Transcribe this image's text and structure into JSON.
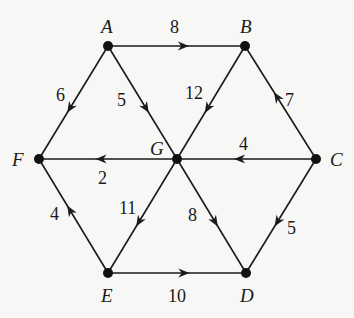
{
  "diagram": {
    "type": "directed-weighted-graph",
    "colors": {
      "background": "#f7f7f5",
      "ink": "#1a1a1a"
    },
    "nodes": [
      {
        "id": "A",
        "label": "A",
        "x": 108,
        "y": 46,
        "label_x": 101,
        "label_y": 33
      },
      {
        "id": "B",
        "label": "B",
        "x": 245,
        "y": 46,
        "label_x": 240,
        "label_y": 33
      },
      {
        "id": "C",
        "label": "C",
        "x": 316,
        "y": 159,
        "label_x": 330,
        "label_y": 166
      },
      {
        "id": "D",
        "label": "D",
        "x": 246,
        "y": 273,
        "label_x": 240,
        "label_y": 302
      },
      {
        "id": "E",
        "label": "E",
        "x": 108,
        "y": 273,
        "label_x": 101,
        "label_y": 302
      },
      {
        "id": "F",
        "label": "F",
        "x": 39,
        "y": 159,
        "label_x": 12,
        "label_y": 166
      },
      {
        "id": "G",
        "label": "G",
        "x": 177,
        "y": 159,
        "label_x": 150,
        "label_y": 155
      }
    ],
    "edges": [
      {
        "from": "A",
        "to": "B",
        "weight": "8",
        "weight_x": 170,
        "weight_y": 33,
        "arrow_t": 0.55
      },
      {
        "from": "A",
        "to": "F",
        "weight": "6",
        "weight_x": 56,
        "weight_y": 101,
        "arrow_t": 0.55
      },
      {
        "from": "A",
        "to": "G",
        "weight": "5",
        "weight_x": 117,
        "weight_y": 106,
        "arrow_t": 0.55
      },
      {
        "from": "B",
        "to": "G",
        "weight": "12",
        "weight_x": 185,
        "weight_y": 99,
        "arrow_t": 0.55
      },
      {
        "from": "C",
        "to": "B",
        "weight": "7",
        "weight_x": 285,
        "weight_y": 106,
        "arrow_t": 0.55
      },
      {
        "from": "C",
        "to": "G",
        "weight": "4",
        "weight_x": 239,
        "weight_y": 150,
        "arrow_t": 0.55
      },
      {
        "from": "G",
        "to": "F",
        "weight": "2",
        "weight_x": 98,
        "weight_y": 184,
        "arrow_t": 0.55
      },
      {
        "from": "G",
        "to": "E",
        "weight": "11",
        "weight_x": 119,
        "weight_y": 214,
        "arrow_t": 0.55
      },
      {
        "from": "G",
        "to": "D",
        "weight": "8",
        "weight_x": 188,
        "weight_y": 221,
        "arrow_t": 0.55
      },
      {
        "from": "C",
        "to": "D",
        "weight": "5",
        "weight_x": 287,
        "weight_y": 234,
        "arrow_t": 0.55
      },
      {
        "from": "E",
        "to": "F",
        "weight": "4",
        "weight_x": 50,
        "weight_y": 220,
        "arrow_t": 0.55
      },
      {
        "from": "E",
        "to": "D",
        "weight": "10",
        "weight_x": 168,
        "weight_y": 302,
        "arrow_t": 0.55
      }
    ]
  }
}
